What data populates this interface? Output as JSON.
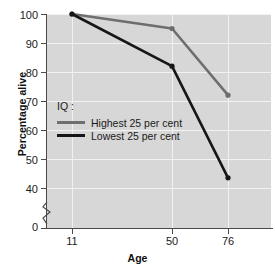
{
  "chart_data": {
    "type": "line",
    "title": "",
    "xlabel": "Age",
    "ylabel": "Percentage alive",
    "categories": [
      "11",
      "50",
      "76"
    ],
    "x": [
      11,
      50,
      76
    ],
    "series": [
      {
        "name": "Highest 25 per cent",
        "values": [
          100,
          95,
          72
        ],
        "color": "#6e6e6e"
      },
      {
        "name": "Lowest 25 per cent",
        "values": [
          100,
          82,
          43.5
        ],
        "color": "#161616"
      }
    ],
    "legend_title": "IQ :",
    "legend_position": "inside-left",
    "grid": true,
    "ylim": [
      40,
      100
    ],
    "yticks": [
      "0",
      "40",
      "50",
      "60",
      "70",
      "80",
      "90",
      "100"
    ],
    "y_axis_break": true,
    "xticks": [
      "11",
      "50",
      "76"
    ],
    "plot_background": "#d7d7d7",
    "gridline_color": "#f2f2f2",
    "axis_color": "#4a4a4a"
  },
  "axis": {
    "y_title": "Percentage alive",
    "x_title": "Age",
    "y_tick_labels": [
      "100",
      "90",
      "80",
      "70",
      "60",
      "50",
      "40",
      "0"
    ],
    "x_tick_labels": [
      "11",
      "50",
      "76"
    ]
  },
  "legend": {
    "title": "IQ :",
    "items": [
      {
        "label": "Highest 25 per cent",
        "color": "#6e6e6e"
      },
      {
        "label": "Lowest 25 per cent",
        "color": "#161616"
      }
    ]
  }
}
